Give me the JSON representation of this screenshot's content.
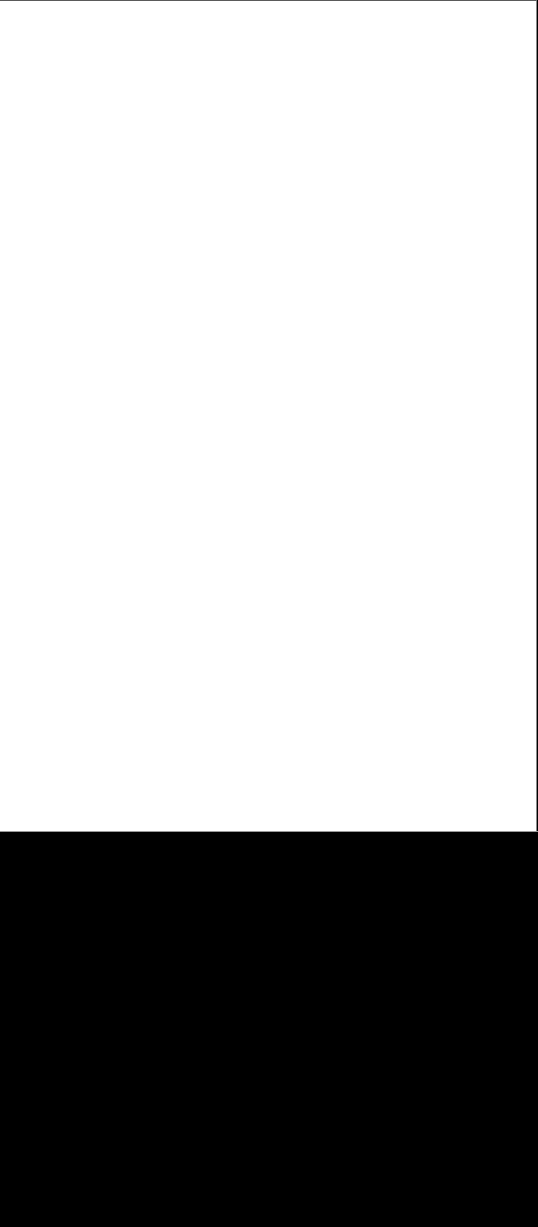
{
  "page": {
    "content": "",
    "background_color": "#ffffff"
  },
  "backdrop": {
    "background_color": "#000000"
  }
}
